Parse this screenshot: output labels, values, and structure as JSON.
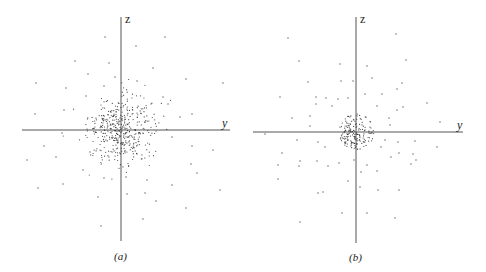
{
  "figure": {
    "panels": [
      {
        "id": "a",
        "caption": "(a)",
        "z_label": "z",
        "y_label": "y"
      },
      {
        "id": "b",
        "caption": "(b)",
        "z_label": "z",
        "y_label": "y"
      }
    ]
  },
  "chart_data": [
    {
      "type": "scatter",
      "title": "(a)",
      "xlabel": "y",
      "ylabel": "z",
      "description": "Gaussian-like point cloud: dense cluster centered at origin, density falling off gradually with radius, sparse outliers",
      "axis_origin_px": [
        121,
        130
      ],
      "axis_extent_px": {
        "x": [
          22,
          230
        ],
        "y": [
          17,
          241
        ]
      },
      "grid": false,
      "cluster": {
        "center": [
          0,
          0
        ],
        "radius_px": 30,
        "falloff": "gradual",
        "approx_points": 420
      },
      "outliers_px": [
        [
          105,
          37
        ],
        [
          136,
          46
        ],
        [
          165,
          37
        ],
        [
          75,
          61
        ],
        [
          109,
          63
        ],
        [
          88,
          74
        ],
        [
          153,
          68
        ],
        [
          36,
          83
        ],
        [
          66,
          88
        ],
        [
          115,
          77
        ],
        [
          104,
          86
        ],
        [
          137,
          81
        ],
        [
          186,
          79
        ],
        [
          223,
          83
        ],
        [
          86,
          96
        ],
        [
          163,
          97
        ],
        [
          168,
          104
        ],
        [
          64,
          110
        ],
        [
          35,
          114
        ],
        [
          192,
          114
        ],
        [
          180,
          117
        ],
        [
          62,
          133
        ],
        [
          44,
          146
        ],
        [
          56,
          157
        ],
        [
          90,
          152
        ],
        [
          172,
          137
        ],
        [
          192,
          146
        ],
        [
          213,
          150
        ],
        [
          27,
          160
        ],
        [
          191,
          164
        ],
        [
          197,
          173
        ],
        [
          83,
          170
        ],
        [
          38,
          188
        ],
        [
          63,
          184
        ],
        [
          104,
          178
        ],
        [
          126,
          177
        ],
        [
          147,
          180
        ],
        [
          172,
          185
        ],
        [
          98,
          197
        ],
        [
          127,
          194
        ],
        [
          145,
          193
        ],
        [
          156,
          201
        ],
        [
          220,
          190
        ],
        [
          186,
          208
        ],
        [
          143,
          219
        ],
        [
          101,
          226
        ]
      ]
    },
    {
      "type": "scatter",
      "title": "(b)",
      "xlabel": "y",
      "ylabel": "z",
      "description": "Uniform dense disk at origin (sharp edge) with sparse scattered outliers",
      "axis_origin_px": [
        356,
        132
      ],
      "axis_extent_px": {
        "x": [
          253,
          463
        ],
        "y": [
          17,
          243
        ]
      },
      "grid": false,
      "cluster": {
        "center": [
          0,
          0
        ],
        "radius_px": 18,
        "falloff": "sharp",
        "approx_points": 170
      },
      "outliers_px": [
        [
          396,
          34
        ],
        [
          288,
          38
        ],
        [
          299,
          61
        ],
        [
          406,
          60
        ],
        [
          340,
          64
        ],
        [
          367,
          66
        ],
        [
          372,
          78
        ],
        [
          308,
          82
        ],
        [
          341,
          81
        ],
        [
          353,
          81
        ],
        [
          402,
          83
        ],
        [
          397,
          89
        ],
        [
          280,
          97
        ],
        [
          326,
          98
        ],
        [
          338,
          99
        ],
        [
          348,
          98
        ],
        [
          316,
          97
        ],
        [
          365,
          94
        ],
        [
          382,
          94
        ],
        [
          316,
          104
        ],
        [
          332,
          106
        ],
        [
          377,
          106
        ],
        [
          403,
          107
        ],
        [
          427,
          103
        ],
        [
          292,
          118
        ],
        [
          310,
          116
        ],
        [
          310,
          126
        ],
        [
          397,
          110
        ],
        [
          389,
          118
        ],
        [
          440,
          122
        ],
        [
          390,
          125
        ],
        [
          265,
          134
        ],
        [
          297,
          140
        ],
        [
          318,
          142
        ],
        [
          385,
          140
        ],
        [
          398,
          142
        ],
        [
          415,
          141
        ],
        [
          437,
          147
        ],
        [
          282,
          153
        ],
        [
          325,
          147
        ],
        [
          381,
          147
        ],
        [
          399,
          153
        ],
        [
          413,
          154
        ],
        [
          300,
          161
        ],
        [
          317,
          161
        ],
        [
          339,
          163
        ],
        [
          278,
          165
        ],
        [
          299,
          166
        ],
        [
          328,
          166
        ],
        [
          354,
          160
        ],
        [
          391,
          157
        ],
        [
          367,
          165
        ],
        [
          377,
          171
        ],
        [
          411,
          164
        ],
        [
          416,
          160
        ],
        [
          278,
          179
        ],
        [
          348,
          181
        ],
        [
          361,
          172
        ],
        [
          360,
          187
        ],
        [
          378,
          190
        ],
        [
          318,
          193
        ],
        [
          323,
          192
        ],
        [
          399,
          190
        ],
        [
          342,
          213
        ],
        [
          367,
          213
        ],
        [
          395,
          218
        ],
        [
          300,
          222
        ]
      ]
    }
  ]
}
